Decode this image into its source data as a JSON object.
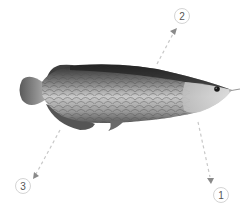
{
  "diagram": {
    "colors": {
      "background": "#ffffff",
      "callout_stroke": "#cfcfcf",
      "callout_text": "#555555",
      "arrow": "#8a8a8a"
    },
    "callouts": [
      {
        "label": "1",
        "position": "bottom-right",
        "points_to": "pectoral fin area"
      },
      {
        "label": "2",
        "position": "top-right",
        "points_to": "dorsal back"
      },
      {
        "label": "3",
        "position": "bottom-left",
        "points_to": "anal/ventral fin area"
      }
    ]
  }
}
